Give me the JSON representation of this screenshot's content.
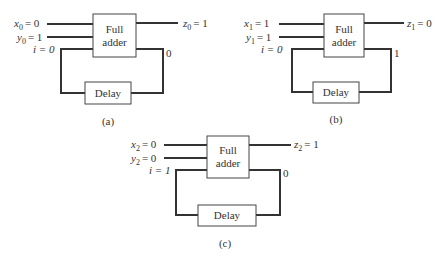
{
  "figure": {
    "panels": [
      {
        "id": "a",
        "caption": "(a)",
        "adder_label": [
          "Full",
          "adder"
        ],
        "delay_label": "Delay",
        "x_label": "x",
        "x_sub": "0",
        "x_val": "= 0",
        "y_label": "y",
        "y_sub": "0",
        "y_val": "= 1",
        "i_label": "i = 0",
        "z_label": "z",
        "z_sub": "0",
        "z_val": "= 1",
        "carry_out": "0"
      },
      {
        "id": "b",
        "caption": "(b)",
        "adder_label": [
          "Full",
          "adder"
        ],
        "delay_label": "Delay",
        "x_label": "x",
        "x_sub": "1",
        "x_val": "= 1",
        "y_label": "y",
        "y_sub": "1",
        "y_val": "= 1",
        "i_label": "i = 0",
        "z_label": "z",
        "z_sub": "1",
        "z_val": "= 0",
        "carry_out": "1"
      },
      {
        "id": "c",
        "caption": "(c)",
        "adder_label": [
          "Full",
          "adder"
        ],
        "delay_label": "Delay",
        "x_label": "x",
        "x_sub": "2",
        "x_val": "= 0",
        "y_label": "y",
        "y_sub": "2",
        "y_val": "= 0",
        "i_label": "i = 1",
        "z_label": "z",
        "z_sub": "2",
        "z_val": "= 1",
        "carry_out": "0"
      }
    ]
  }
}
